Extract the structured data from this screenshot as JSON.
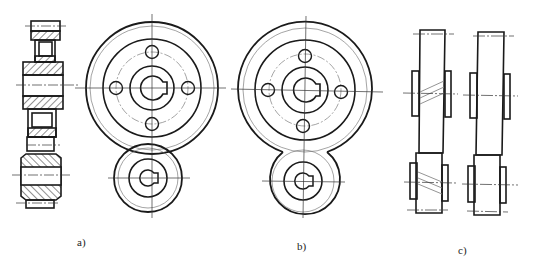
{
  "figure": {
    "panels": [
      {
        "id": "a",
        "label": "a)",
        "description": "Spur gear pair: sectional view and front view"
      },
      {
        "id": "b",
        "label": "b)",
        "description": "Spur gear pair front view, simplified meshing"
      },
      {
        "id": "c",
        "label": "c)",
        "description": "Helical gear pair outline views"
      }
    ]
  },
  "colors": {
    "line": "#1a1a1a",
    "thin": "#555555",
    "background": "#ffffff"
  }
}
